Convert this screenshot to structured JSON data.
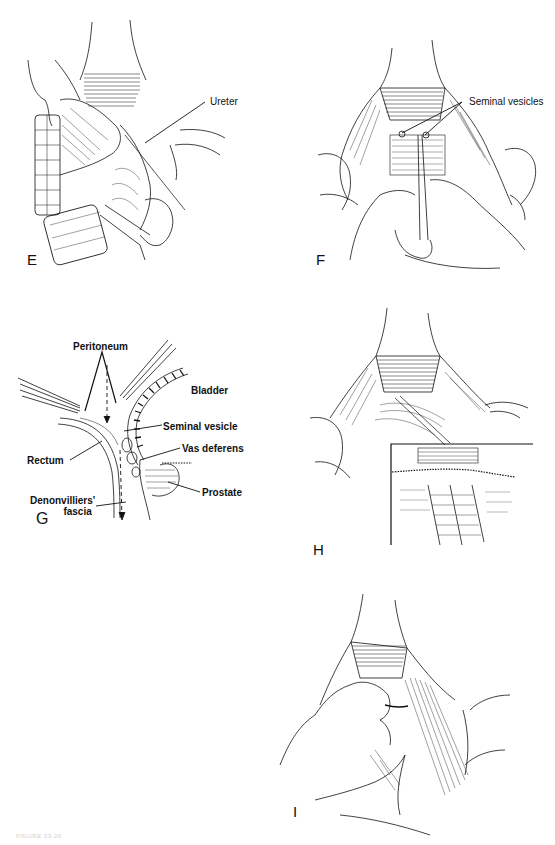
{
  "figure": {
    "caption": "FIGURE 33-26",
    "panels": [
      {
        "id": "E",
        "label": "E",
        "annotations": [
          "Ureter"
        ]
      },
      {
        "id": "F",
        "label": "F",
        "annotations": [
          "Seminal vesicles"
        ]
      },
      {
        "id": "G",
        "label": "G",
        "annotations": [
          "Peritoneum",
          "Bladder",
          "Seminal vesicle",
          "Vas deferens",
          "Rectum",
          "Prostate",
          "Denonvilliers' fascia"
        ]
      },
      {
        "id": "H",
        "label": "H",
        "annotations": []
      },
      {
        "id": "I",
        "label": "I",
        "annotations": []
      }
    ]
  },
  "panel_e": {
    "label": "E",
    "ureter": "Ureter"
  },
  "panel_f": {
    "label": "F",
    "seminal_vesicles": "Seminal vesicles"
  },
  "panel_g": {
    "label": "G",
    "peritoneum": "Peritoneum",
    "bladder": "Bladder",
    "seminal_vesicle": "Seminal vesicle",
    "vas_deferens": "Vas deferens",
    "rectum": "Rectum",
    "prostate": "Prostate",
    "denonvilliers_line1": "Denonvilliers'",
    "denonvilliers_line2": "fascia"
  },
  "panel_h": {
    "label": "H"
  },
  "panel_i": {
    "label": "I"
  },
  "colors": {
    "ink": "#111111",
    "background": "#ffffff",
    "caption": "#cfcfcf"
  }
}
